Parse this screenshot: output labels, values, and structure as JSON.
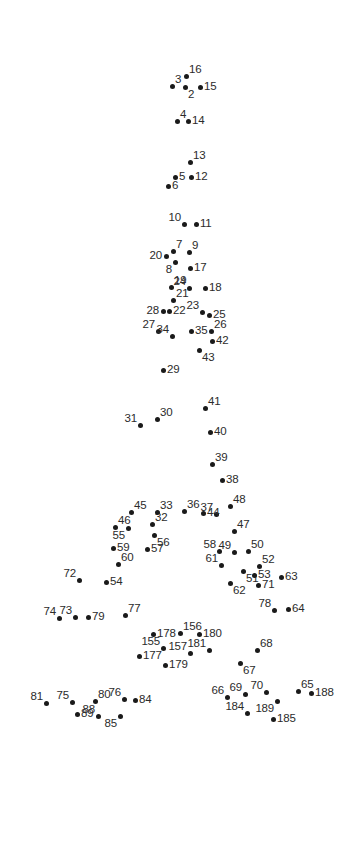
{
  "page": {
    "background_color": "#ffffff",
    "dot_color": "#1a1a1a",
    "label_color": "#2b2b2b",
    "width": 351,
    "height": 844
  },
  "dots": [
    {
      "n": "2",
      "x": 185,
      "y": 87,
      "lp": "se"
    },
    {
      "n": "3",
      "x": 172,
      "y": 86,
      "lp": "ne"
    },
    {
      "n": "4",
      "x": 177,
      "y": 121,
      "lp": "ne"
    },
    {
      "n": "5",
      "x": 175,
      "y": 177,
      "lp": "e"
    },
    {
      "n": "6",
      "x": 168,
      "y": 186,
      "lp": "e"
    },
    {
      "n": "7",
      "x": 173,
      "y": 251,
      "lp": "ne"
    },
    {
      "n": "8",
      "x": 175,
      "y": 262,
      "lp": "sw"
    },
    {
      "n": "9",
      "x": 189,
      "y": 252,
      "lp": "ne"
    },
    {
      "n": "10",
      "x": 184,
      "y": 224,
      "lp": "nw"
    },
    {
      "n": "11",
      "x": 196,
      "y": 224,
      "lp": "e"
    },
    {
      "n": "12",
      "x": 191,
      "y": 177,
      "lp": "e"
    },
    {
      "n": "13",
      "x": 190,
      "y": 162,
      "lp": "ne"
    },
    {
      "n": "14",
      "x": 188,
      "y": 121,
      "lp": "e"
    },
    {
      "n": "15",
      "x": 200,
      "y": 87,
      "lp": "e"
    },
    {
      "n": "16",
      "x": 186,
      "y": 76,
      "lp": "ne"
    },
    {
      "n": "17",
      "x": 190,
      "y": 268,
      "lp": "e"
    },
    {
      "n": "18",
      "x": 205,
      "y": 288,
      "lp": "e"
    },
    {
      "n": "19",
      "x": 171,
      "y": 287,
      "lp": "ne"
    },
    {
      "n": "20",
      "x": 166,
      "y": 256,
      "lp": "w"
    },
    {
      "n": "21",
      "x": 173,
      "y": 300,
      "lp": "ne"
    },
    {
      "n": "22",
      "x": 169,
      "y": 311,
      "lp": "e"
    },
    {
      "n": "23",
      "x": 202,
      "y": 312,
      "lp": "nw"
    },
    {
      "n": "24",
      "x": 189,
      "y": 288,
      "lp": "nw"
    },
    {
      "n": "25",
      "x": 209,
      "y": 315,
      "lp": "e"
    },
    {
      "n": "26",
      "x": 211,
      "y": 331,
      "lp": "ne"
    },
    {
      "n": "27",
      "x": 158,
      "y": 331,
      "lp": "nw"
    },
    {
      "n": "28",
      "x": 163,
      "y": 311,
      "lp": "w"
    },
    {
      "n": "29",
      "x": 163,
      "y": 370,
      "lp": "e"
    },
    {
      "n": "30",
      "x": 157,
      "y": 419,
      "lp": "ne"
    },
    {
      "n": "31",
      "x": 140,
      "y": 425,
      "lp": "nw"
    },
    {
      "n": "32",
      "x": 152,
      "y": 524,
      "lp": "ne"
    },
    {
      "n": "33",
      "x": 157,
      "y": 512,
      "lp": "ne"
    },
    {
      "n": "34",
      "x": 172,
      "y": 336,
      "lp": "nw"
    },
    {
      "n": "35",
      "x": 191,
      "y": 331,
      "lp": "e"
    },
    {
      "n": "36",
      "x": 184,
      "y": 511,
      "lp": "ne"
    },
    {
      "n": "37",
      "x": 216,
      "y": 514,
      "lp": "nw"
    },
    {
      "n": "38",
      "x": 222,
      "y": 480,
      "lp": "e"
    },
    {
      "n": "39",
      "x": 212,
      "y": 464,
      "lp": "ne"
    },
    {
      "n": "40",
      "x": 210,
      "y": 432,
      "lp": "e"
    },
    {
      "n": "41",
      "x": 205,
      "y": 408,
      "lp": "ne"
    },
    {
      "n": "42",
      "x": 212,
      "y": 341,
      "lp": "e"
    },
    {
      "n": "43",
      "x": 199,
      "y": 350,
      "lp": "se"
    },
    {
      "n": "44",
      "x": 203,
      "y": 513,
      "lp": "e"
    },
    {
      "n": "45",
      "x": 131,
      "y": 512,
      "lp": "ne"
    },
    {
      "n": "46",
      "x": 115,
      "y": 527,
      "lp": "ne"
    },
    {
      "n": "47",
      "x": 234,
      "y": 531,
      "lp": "ne"
    },
    {
      "n": "48",
      "x": 230,
      "y": 506,
      "lp": "ne"
    },
    {
      "n": "49",
      "x": 234,
      "y": 552,
      "lp": "nw"
    },
    {
      "n": "50",
      "x": 248,
      "y": 551,
      "lp": "ne"
    },
    {
      "n": "51",
      "x": 243,
      "y": 571,
      "lp": "se"
    },
    {
      "n": "52",
      "x": 259,
      "y": 566,
      "lp": "ne"
    },
    {
      "n": "53",
      "x": 254,
      "y": 575,
      "lp": "e"
    },
    {
      "n": "54",
      "x": 106,
      "y": 582,
      "lp": "e"
    },
    {
      "n": "55",
      "x": 128,
      "y": 528,
      "lp": "sw"
    },
    {
      "n": "56",
      "x": 154,
      "y": 535,
      "lp": "se"
    },
    {
      "n": "57",
      "x": 147,
      "y": 549,
      "lp": "e"
    },
    {
      "n": "58",
      "x": 219,
      "y": 551,
      "lp": "nw"
    },
    {
      "n": "59",
      "x": 113,
      "y": 548,
      "lp": "e"
    },
    {
      "n": "60",
      "x": 118,
      "y": 564,
      "lp": "ne"
    },
    {
      "n": "61",
      "x": 221,
      "y": 565,
      "lp": "nw"
    },
    {
      "n": "62",
      "x": 230,
      "y": 583,
      "lp": "se"
    },
    {
      "n": "63",
      "x": 281,
      "y": 577,
      "lp": "e"
    },
    {
      "n": "64",
      "x": 288,
      "y": 609,
      "lp": "e"
    },
    {
      "n": "65",
      "x": 298,
      "y": 691,
      "lp": "ne"
    },
    {
      "n": "66",
      "x": 227,
      "y": 697,
      "lp": "nw"
    },
    {
      "n": "67",
      "x": 240,
      "y": 663,
      "lp": "se"
    },
    {
      "n": "68",
      "x": 257,
      "y": 650,
      "lp": "ne"
    },
    {
      "n": "69",
      "x": 245,
      "y": 694,
      "lp": "nw"
    },
    {
      "n": "70",
      "x": 266,
      "y": 692,
      "lp": "nw"
    },
    {
      "n": "71",
      "x": 258,
      "y": 585,
      "lp": "e"
    },
    {
      "n": "72",
      "x": 79,
      "y": 580,
      "lp": "nw"
    },
    {
      "n": "73",
      "x": 75,
      "y": 617,
      "lp": "nw"
    },
    {
      "n": "74",
      "x": 59,
      "y": 618,
      "lp": "nw"
    },
    {
      "n": "75",
      "x": 72,
      "y": 702,
      "lp": "nw"
    },
    {
      "n": "76",
      "x": 124,
      "y": 699,
      "lp": "nw"
    },
    {
      "n": "77",
      "x": 125,
      "y": 615,
      "lp": "ne"
    },
    {
      "n": "78",
      "x": 274,
      "y": 610,
      "lp": "nw"
    },
    {
      "n": "79",
      "x": 88,
      "y": 617,
      "lp": "e"
    },
    {
      "n": "80",
      "x": 95,
      "y": 701,
      "lp": "ne"
    },
    {
      "n": "81",
      "x": 46,
      "y": 703,
      "lp": "nw"
    },
    {
      "n": "84",
      "x": 135,
      "y": 700,
      "lp": "e"
    },
    {
      "n": "85",
      "x": 120,
      "y": 716,
      "lp": "sw"
    },
    {
      "n": "88",
      "x": 98,
      "y": 716,
      "lp": "nw"
    },
    {
      "n": "89",
      "x": 77,
      "y": 714,
      "lp": "e"
    },
    {
      "n": "155",
      "x": 163,
      "y": 648,
      "lp": "nw"
    },
    {
      "n": "156",
      "x": 180,
      "y": 633,
      "lp": "ne"
    },
    {
      "n": "157",
      "x": 190,
      "y": 653,
      "lp": "nw"
    },
    {
      "n": "177",
      "x": 139,
      "y": 656,
      "lp": "e"
    },
    {
      "n": "178",
      "x": 153,
      "y": 634,
      "lp": "e"
    },
    {
      "n": "179",
      "x": 165,
      "y": 665,
      "lp": "e"
    },
    {
      "n": "180",
      "x": 199,
      "y": 634,
      "lp": "e"
    },
    {
      "n": "181",
      "x": 209,
      "y": 650,
      "lp": "nw"
    },
    {
      "n": "184",
      "x": 247,
      "y": 713,
      "lp": "nw"
    },
    {
      "n": "185",
      "x": 273,
      "y": 719,
      "lp": "e"
    },
    {
      "n": "188",
      "x": 311,
      "y": 693,
      "lp": "e"
    },
    {
      "n": "189",
      "x": 277,
      "y": 701,
      "lp": "sw"
    }
  ]
}
